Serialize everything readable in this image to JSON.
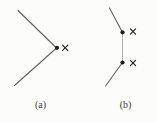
{
  "figure": {
    "background": "#fcfcfa",
    "line_color": "#606060",
    "connector_color": "#a8a8a8",
    "marker_color": "#1c1c1c",
    "label_color": "#3b3b3b",
    "marker_symbol": "×",
    "panels": [
      {
        "id": "a",
        "label": "(a)",
        "label_x": 40.5,
        "label_y": 108,
        "lines": [
          {
            "x1": 18,
            "y1": 10.5,
            "x2": 56.5,
            "y2": 48,
            "kind": "edge"
          },
          {
            "x1": 56.5,
            "y1": 48,
            "x2": 14.5,
            "y2": 85.5,
            "kind": "edge"
          }
        ],
        "dots": [
          {
            "cx": 57,
            "cy": 47.8,
            "r": 2.1
          }
        ],
        "crosses": [
          {
            "cx": 65.2,
            "cy": 47.8,
            "half": 2.6
          }
        ]
      },
      {
        "id": "b",
        "label": "(b)",
        "label_x": 125.5,
        "label_y": 108,
        "lines": [
          {
            "x1": 109.5,
            "y1": 8,
            "x2": 122.5,
            "y2": 32.5,
            "kind": "edge"
          },
          {
            "x1": 122.5,
            "y1": 32.5,
            "x2": 122.5,
            "y2": 62.5,
            "kind": "connector"
          },
          {
            "x1": 122.5,
            "y1": 62.5,
            "x2": 105.5,
            "y2": 86,
            "kind": "edge"
          }
        ],
        "dots": [
          {
            "cx": 122.5,
            "cy": 32.3,
            "r": 2.1
          },
          {
            "cx": 122.5,
            "cy": 62.5,
            "r": 2.1
          }
        ],
        "crosses": [
          {
            "cx": 133,
            "cy": 31.5,
            "half": 2.6
          },
          {
            "cx": 133,
            "cy": 63,
            "half": 2.6
          }
        ]
      }
    ]
  }
}
